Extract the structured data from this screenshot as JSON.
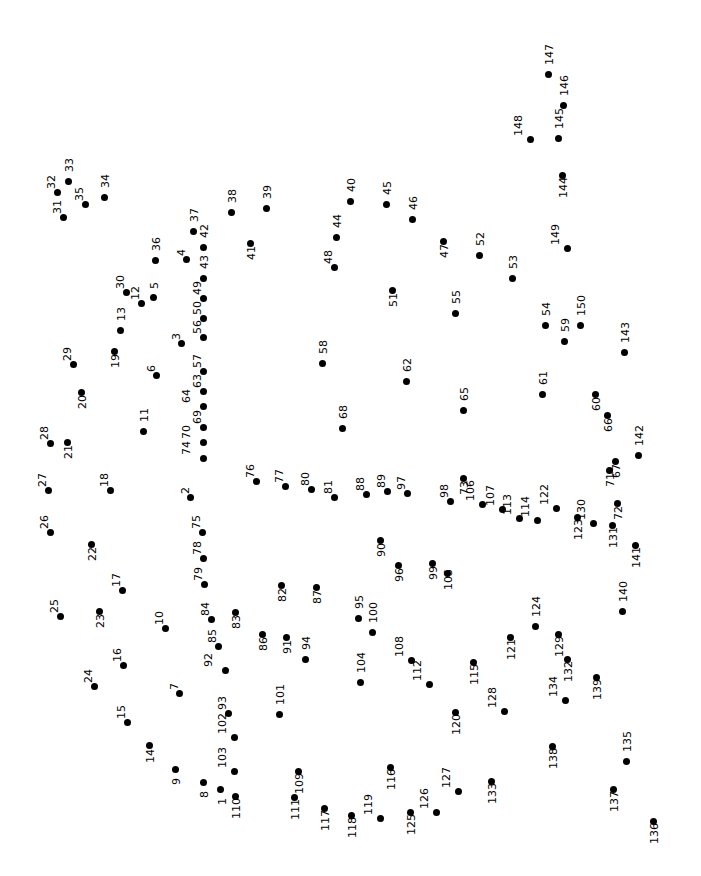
{
  "puzzle": {
    "title": "Connect the Dots Puzzle",
    "type": "connect-the-dots",
    "width": 701,
    "height": 876,
    "background_color": "#ffffff",
    "dot_color": "#000000",
    "label_color": "#000000",
    "label_rotation_deg": -90,
    "dot_count": 150,
    "number_range": [
      1,
      150
    ],
    "dots": [
      {
        "n": "1",
        "x": 220,
        "y": 789,
        "lx": -3,
        "ly": 16
      },
      {
        "n": "2",
        "x": 190,
        "y": 497,
        "lx": -10,
        "ly": -3
      },
      {
        "n": "3",
        "x": 181,
        "y": 343,
        "lx": -10,
        "ly": -3
      },
      {
        "n": "4",
        "x": 186,
        "y": 259,
        "lx": -10,
        "ly": -3
      },
      {
        "n": "5",
        "x": 153,
        "y": 297,
        "lx": -4,
        "ly": -8
      },
      {
        "n": "6",
        "x": 156,
        "y": 375,
        "lx": -10,
        "ly": -3
      },
      {
        "n": "7",
        "x": 179,
        "y": 693,
        "lx": -10,
        "ly": -3
      },
      {
        "n": "8",
        "x": 203,
        "y": 782,
        "lx": -4,
        "ly": 16
      },
      {
        "n": "9",
        "x": 175,
        "y": 769,
        "lx": -4,
        "ly": 16
      },
      {
        "n": "10",
        "x": 165,
        "y": 628,
        "lx": -11,
        "ly": -3
      },
      {
        "n": "11",
        "x": 143,
        "y": 431,
        "lx": -4,
        "ly": -9
      },
      {
        "n": "12",
        "x": 141,
        "y": 303,
        "lx": -11,
        "ly": -3
      },
      {
        "n": "13",
        "x": 120,
        "y": 330,
        "lx": -4,
        "ly": -9
      },
      {
        "n": "14",
        "x": 149,
        "y": 745,
        "lx": -4,
        "ly": 18
      },
      {
        "n": "15",
        "x": 127,
        "y": 722,
        "lx": -11,
        "ly": -3
      },
      {
        "n": "16",
        "x": 123,
        "y": 665,
        "lx": -11,
        "ly": -3
      },
      {
        "n": "17",
        "x": 122,
        "y": 590,
        "lx": -11,
        "ly": -3
      },
      {
        "n": "18",
        "x": 110,
        "y": 490,
        "lx": -11,
        "ly": -3
      },
      {
        "n": "19",
        "x": 114,
        "y": 351,
        "lx": -4,
        "ly": 17
      },
      {
        "n": "20",
        "x": 81,
        "y": 392,
        "lx": -4,
        "ly": 17
      },
      {
        "n": "21",
        "x": 67,
        "y": 442,
        "lx": -4,
        "ly": 17
      },
      {
        "n": "22",
        "x": 91,
        "y": 544,
        "lx": -4,
        "ly": 17
      },
      {
        "n": "23",
        "x": 99,
        "y": 611,
        "lx": -4,
        "ly": 17
      },
      {
        "n": "24",
        "x": 94,
        "y": 686,
        "lx": -11,
        "ly": -3
      },
      {
        "n": "25",
        "x": 60,
        "y": 616,
        "lx": -11,
        "ly": -3
      },
      {
        "n": "26",
        "x": 50,
        "y": 532,
        "lx": -11,
        "ly": -3
      },
      {
        "n": "27",
        "x": 48,
        "y": 490,
        "lx": -11,
        "ly": -3
      },
      {
        "n": "28",
        "x": 50,
        "y": 443,
        "lx": -11,
        "ly": -3
      },
      {
        "n": "29",
        "x": 73,
        "y": 364,
        "lx": -11,
        "ly": -3
      },
      {
        "n": "30",
        "x": 126,
        "y": 292,
        "lx": -11,
        "ly": -3
      },
      {
        "n": "31",
        "x": 63,
        "y": 217,
        "lx": -11,
        "ly": -3
      },
      {
        "n": "32",
        "x": 57,
        "y": 192,
        "lx": -11,
        "ly": -3
      },
      {
        "n": "33",
        "x": 68,
        "y": 181,
        "lx": -4,
        "ly": -9
      },
      {
        "n": "34",
        "x": 104,
        "y": 197,
        "lx": -4,
        "ly": -9
      },
      {
        "n": "35",
        "x": 85,
        "y": 204,
        "lx": -11,
        "ly": -3
      },
      {
        "n": "36",
        "x": 155,
        "y": 260,
        "lx": -4,
        "ly": -9
      },
      {
        "n": "37",
        "x": 193,
        "y": 231,
        "lx": -4,
        "ly": -9
      },
      {
        "n": "38",
        "x": 231,
        "y": 212,
        "lx": -4,
        "ly": -9
      },
      {
        "n": "39",
        "x": 266,
        "y": 208,
        "lx": -4,
        "ly": -9
      },
      {
        "n": "40",
        "x": 350,
        "y": 201,
        "lx": -4,
        "ly": -9
      },
      {
        "n": "41",
        "x": 250,
        "y": 243,
        "lx": -4,
        "ly": 17
      },
      {
        "n": "42",
        "x": 203,
        "y": 247,
        "lx": -4,
        "ly": -9
      },
      {
        "n": "43",
        "x": 203,
        "y": 278,
        "lx": -4,
        "ly": -9
      },
      {
        "n": "44",
        "x": 336,
        "y": 237,
        "lx": -4,
        "ly": -9
      },
      {
        "n": "45",
        "x": 386,
        "y": 204,
        "lx": -4,
        "ly": -9
      },
      {
        "n": "46",
        "x": 412,
        "y": 219,
        "lx": -4,
        "ly": -9
      },
      {
        "n": "47",
        "x": 443,
        "y": 241,
        "lx": -4,
        "ly": 17
      },
      {
        "n": "48",
        "x": 334,
        "y": 267,
        "lx": -11,
        "ly": -3
      },
      {
        "n": "49",
        "x": 203,
        "y": 298,
        "lx": -11,
        "ly": -3
      },
      {
        "n": "50",
        "x": 203,
        "y": 318,
        "lx": -11,
        "ly": -3
      },
      {
        "n": "51",
        "x": 392,
        "y": 290,
        "lx": -4,
        "ly": 17
      },
      {
        "n": "52",
        "x": 479,
        "y": 255,
        "lx": -4,
        "ly": -9
      },
      {
        "n": "53",
        "x": 512,
        "y": 278,
        "lx": -4,
        "ly": -9
      },
      {
        "n": "54",
        "x": 545,
        "y": 325,
        "lx": -4,
        "ly": -9
      },
      {
        "n": "55",
        "x": 455,
        "y": 313,
        "lx": -4,
        "ly": -9
      },
      {
        "n": "56",
        "x": 203,
        "y": 337,
        "lx": -11,
        "ly": -3
      },
      {
        "n": "57",
        "x": 203,
        "y": 371,
        "lx": -11,
        "ly": -3
      },
      {
        "n": "58",
        "x": 322,
        "y": 363,
        "lx": -4,
        "ly": -9
      },
      {
        "n": "59",
        "x": 564,
        "y": 341,
        "lx": -4,
        "ly": -9
      },
      {
        "n": "60",
        "x": 595,
        "y": 394,
        "lx": -4,
        "ly": 17
      },
      {
        "n": "61",
        "x": 542,
        "y": 394,
        "lx": -4,
        "ly": -9
      },
      {
        "n": "62",
        "x": 406,
        "y": 381,
        "lx": -4,
        "ly": -9
      },
      {
        "n": "63",
        "x": 203,
        "y": 391,
        "lx": -11,
        "ly": -3
      },
      {
        "n": "64",
        "x": 203,
        "y": 406,
        "lx": -22,
        "ly": -3
      },
      {
        "n": "65",
        "x": 463,
        "y": 410,
        "lx": -4,
        "ly": -9
      },
      {
        "n": "66",
        "x": 607,
        "y": 415,
        "lx": -4,
        "ly": 17
      },
      {
        "n": "67",
        "x": 615,
        "y": 461,
        "lx": -4,
        "ly": 17
      },
      {
        "n": "68",
        "x": 342,
        "y": 428,
        "lx": -4,
        "ly": -9
      },
      {
        "n": "69",
        "x": 203,
        "y": 427,
        "lx": -11,
        "ly": -3
      },
      {
        "n": "70",
        "x": 203,
        "y": 442,
        "lx": -22,
        "ly": -3
      },
      {
        "n": "71",
        "x": 609,
        "y": 470,
        "lx": -4,
        "ly": 17
      },
      {
        "n": "72",
        "x": 617,
        "y": 503,
        "lx": -4,
        "ly": 17
      },
      {
        "n": "73",
        "x": 463,
        "y": 478,
        "lx": -4,
        "ly": 17
      },
      {
        "n": "74",
        "x": 203,
        "y": 458,
        "lx": -22,
        "ly": -3
      },
      {
        "n": "75",
        "x": 202,
        "y": 532,
        "lx": -11,
        "ly": -3
      },
      {
        "n": "76",
        "x": 256,
        "y": 481,
        "lx": -11,
        "ly": -3
      },
      {
        "n": "77",
        "x": 285,
        "y": 486,
        "lx": -11,
        "ly": -3
      },
      {
        "n": "78",
        "x": 203,
        "y": 558,
        "lx": -11,
        "ly": -3
      },
      {
        "n": "79",
        "x": 204,
        "y": 584,
        "lx": -11,
        "ly": -3
      },
      {
        "n": "80",
        "x": 311,
        "y": 489,
        "lx": -11,
        "ly": -3
      },
      {
        "n": "81",
        "x": 334,
        "y": 497,
        "lx": -11,
        "ly": -3
      },
      {
        "n": "82",
        "x": 281,
        "y": 585,
        "lx": -4,
        "ly": 17
      },
      {
        "n": "83",
        "x": 235,
        "y": 612,
        "lx": -4,
        "ly": 17
      },
      {
        "n": "84",
        "x": 211,
        "y": 619,
        "lx": -11,
        "ly": -3
      },
      {
        "n": "85",
        "x": 218,
        "y": 646,
        "lx": -11,
        "ly": -3
      },
      {
        "n": "86",
        "x": 262,
        "y": 634,
        "lx": -4,
        "ly": 17
      },
      {
        "n": "87",
        "x": 316,
        "y": 587,
        "lx": -4,
        "ly": 17
      },
      {
        "n": "88",
        "x": 366,
        "y": 494,
        "lx": -11,
        "ly": -3
      },
      {
        "n": "89",
        "x": 387,
        "y": 491,
        "lx": -11,
        "ly": -3
      },
      {
        "n": "90",
        "x": 380,
        "y": 540,
        "lx": -4,
        "ly": 17
      },
      {
        "n": "91",
        "x": 286,
        "y": 637,
        "lx": -4,
        "ly": 17
      },
      {
        "n": "92",
        "x": 225,
        "y": 670,
        "lx": -22,
        "ly": -3
      },
      {
        "n": "93",
        "x": 228,
        "y": 713,
        "lx": -11,
        "ly": -3
      },
      {
        "n": "94",
        "x": 305,
        "y": 659,
        "lx": -4,
        "ly": -9
      },
      {
        "n": "95",
        "x": 358,
        "y": 618,
        "lx": -4,
        "ly": -9
      },
      {
        "n": "96",
        "x": 398,
        "y": 565,
        "lx": -4,
        "ly": 17
      },
      {
        "n": "97",
        "x": 407,
        "y": 493,
        "lx": -11,
        "ly": -3
      },
      {
        "n": "98",
        "x": 450,
        "y": 501,
        "lx": -11,
        "ly": -3
      },
      {
        "n": "99",
        "x": 432,
        "y": 563,
        "lx": -4,
        "ly": 17
      },
      {
        "n": "100",
        "x": 372,
        "y": 632,
        "lx": -4,
        "ly": -9
      },
      {
        "n": "101",
        "x": 279,
        "y": 714,
        "lx": -4,
        "ly": -9
      },
      {
        "n": "102",
        "x": 234,
        "y": 737,
        "lx": -17,
        "ly": -3
      },
      {
        "n": "103",
        "x": 234,
        "y": 771,
        "lx": -17,
        "ly": -3
      },
      {
        "n": "104",
        "x": 360,
        "y": 682,
        "lx": -4,
        "ly": -9
      },
      {
        "n": "105",
        "x": 447,
        "y": 573,
        "lx": -4,
        "ly": 17
      },
      {
        "n": "106",
        "x": 482,
        "y": 504,
        "lx": -17,
        "ly": -3
      },
      {
        "n": "107",
        "x": 502,
        "y": 509,
        "lx": -17,
        "ly": -3
      },
      {
        "n": "108",
        "x": 411,
        "y": 660,
        "lx": -17,
        "ly": -3
      },
      {
        "n": "109",
        "x": 298,
        "y": 771,
        "lx": -4,
        "ly": 23
      },
      {
        "n": "110",
        "x": 235,
        "y": 796,
        "lx": -4,
        "ly": 23
      },
      {
        "n": "111",
        "x": 294,
        "y": 797,
        "lx": -4,
        "ly": 23
      },
      {
        "n": "112",
        "x": 429,
        "y": 684,
        "lx": -17,
        "ly": -3
      },
      {
        "n": "113",
        "x": 519,
        "y": 518,
        "lx": -17,
        "ly": -3
      },
      {
        "n": "114",
        "x": 537,
        "y": 520,
        "lx": -17,
        "ly": -3
      },
      {
        "n": "115",
        "x": 473,
        "y": 662,
        "lx": -4,
        "ly": 23
      },
      {
        "n": "116",
        "x": 390,
        "y": 767,
        "lx": -4,
        "ly": 23
      },
      {
        "n": "117",
        "x": 324,
        "y": 808,
        "lx": -4,
        "ly": 23
      },
      {
        "n": "118",
        "x": 351,
        "y": 815,
        "lx": -4,
        "ly": 23
      },
      {
        "n": "119",
        "x": 380,
        "y": 818,
        "lx": -17,
        "ly": -3
      },
      {
        "n": "120",
        "x": 455,
        "y": 712,
        "lx": -4,
        "ly": 23
      },
      {
        "n": "121",
        "x": 510,
        "y": 637,
        "lx": -4,
        "ly": 23
      },
      {
        "n": "122",
        "x": 556,
        "y": 508,
        "lx": -17,
        "ly": -3
      },
      {
        "n": "123",
        "x": 577,
        "y": 517,
        "lx": -4,
        "ly": 23
      },
      {
        "n": "124",
        "x": 535,
        "y": 626,
        "lx": -4,
        "ly": -9
      },
      {
        "n": "125",
        "x": 410,
        "y": 812,
        "lx": -4,
        "ly": 23
      },
      {
        "n": "126",
        "x": 436,
        "y": 812,
        "lx": -17,
        "ly": -3
      },
      {
        "n": "127",
        "x": 458,
        "y": 791,
        "lx": -17,
        "ly": -3
      },
      {
        "n": "128",
        "x": 504,
        "y": 711,
        "lx": -17,
        "ly": -3
      },
      {
        "n": "129",
        "x": 558,
        "y": 634,
        "lx": -4,
        "ly": 23
      },
      {
        "n": "130",
        "x": 593,
        "y": 523,
        "lx": -17,
        "ly": -3
      },
      {
        "n": "131",
        "x": 612,
        "y": 525,
        "lx": -4,
        "ly": 23
      },
      {
        "n": "132",
        "x": 567,
        "y": 659,
        "lx": -4,
        "ly": 23
      },
      {
        "n": "133",
        "x": 491,
        "y": 781,
        "lx": -4,
        "ly": 23
      },
      {
        "n": "134",
        "x": 565,
        "y": 700,
        "lx": -17,
        "ly": -3
      },
      {
        "n": "135",
        "x": 626,
        "y": 761,
        "lx": -4,
        "ly": -9
      },
      {
        "n": "136",
        "x": 653,
        "y": 821,
        "lx": -4,
        "ly": 23
      },
      {
        "n": "137",
        "x": 613,
        "y": 789,
        "lx": -4,
        "ly": 23
      },
      {
        "n": "138",
        "x": 552,
        "y": 746,
        "lx": -4,
        "ly": 23
      },
      {
        "n": "139",
        "x": 596,
        "y": 677,
        "lx": -4,
        "ly": 23
      },
      {
        "n": "140",
        "x": 622,
        "y": 611,
        "lx": -4,
        "ly": -9
      },
      {
        "n": "141",
        "x": 635,
        "y": 545,
        "lx": -4,
        "ly": 23
      },
      {
        "n": "142",
        "x": 638,
        "y": 455,
        "lx": -4,
        "ly": -9
      },
      {
        "n": "143",
        "x": 624,
        "y": 352,
        "lx": -4,
        "ly": -9
      },
      {
        "n": "144",
        "x": 562,
        "y": 175,
        "lx": -4,
        "ly": 23
      },
      {
        "n": "145",
        "x": 558,
        "y": 138,
        "lx": -4,
        "ly": -9
      },
      {
        "n": "146",
        "x": 563,
        "y": 105,
        "lx": -4,
        "ly": -9
      },
      {
        "n": "147",
        "x": 548,
        "y": 74,
        "lx": -4,
        "ly": -9
      },
      {
        "n": "148",
        "x": 530,
        "y": 139,
        "lx": -17,
        "ly": -3
      },
      {
        "n": "149",
        "x": 567,
        "y": 248,
        "lx": -17,
        "ly": -3
      },
      {
        "n": "150",
        "x": 580,
        "y": 325,
        "lx": -4,
        "ly": -9
      }
    ]
  }
}
